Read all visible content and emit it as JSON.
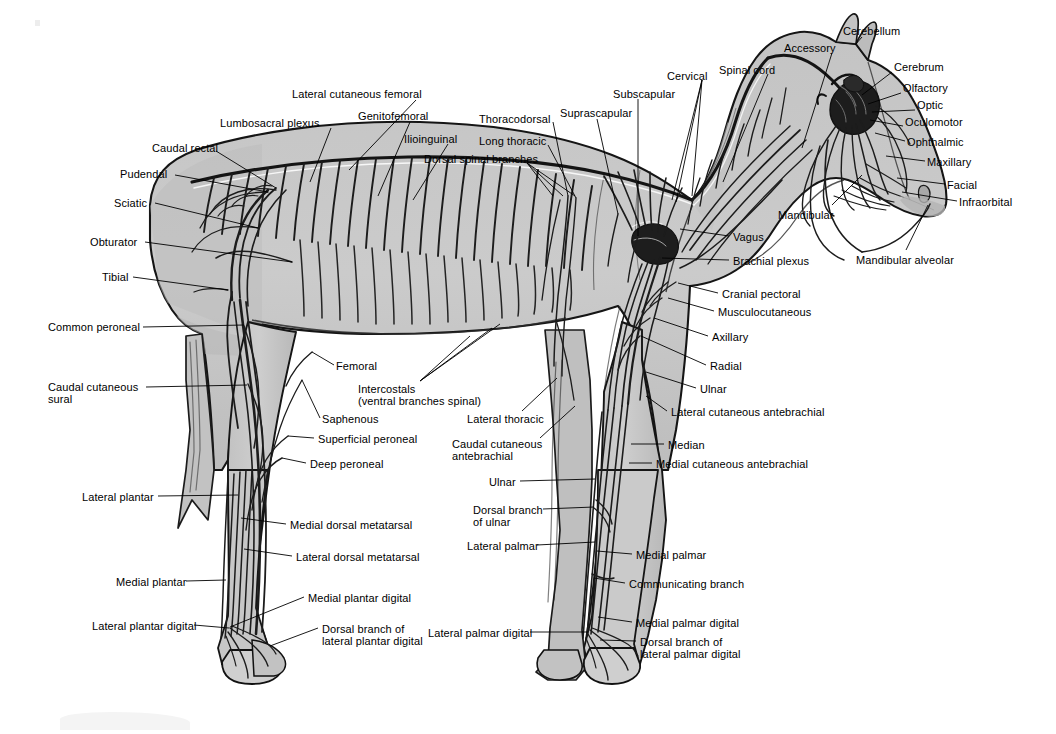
{
  "figure": {
    "view": "left lateral",
    "background_color": "#ffffff",
    "body_fill_color": "#c9c9c9",
    "body_fill_shadow": "#b0b0b0",
    "outline_color": "#111111",
    "nerve_color": "#1a1a1a",
    "leader_color": "#000000",
    "label_color": "#000000",
    "label_font_size_px": 11
  },
  "labels": [
    {
      "id": "lateral-cutaneous-femoral",
      "text": "Lateral cutaneous femoral",
      "x": 292,
      "y": 88,
      "align": "left",
      "leader": [
        [
          416,
          100
        ],
        [
          349,
          170
        ]
      ]
    },
    {
      "id": "lumbosacral-plexus",
      "text": "Lumbosacral plexus",
      "x": 220,
      "y": 117,
      "align": "left",
      "leader": [
        [
          331,
          128
        ],
        [
          310,
          182
        ]
      ]
    },
    {
      "id": "genitofemoral",
      "text": "Genitofemoral",
      "x": 358,
      "y": 110,
      "align": "left",
      "leader": [
        [
          410,
          122
        ],
        [
          378,
          196
        ]
      ]
    },
    {
      "id": "caudal-rectal",
      "text": "Caudal rectal",
      "x": 152,
      "y": 142,
      "align": "left",
      "leader": [
        [
          216,
          151
        ],
        [
          276,
          188
        ]
      ]
    },
    {
      "id": "ilioinguinal",
      "text": "Ilioinguinal",
      "x": 404,
      "y": 133,
      "align": "left",
      "leader": [
        [
          448,
          144
        ],
        [
          413,
          200
        ]
      ]
    },
    {
      "id": "dorsal-spinal-branches",
      "text": "Dorsal spinal branches",
      "x": 424,
      "y": 153,
      "align": "left",
      "leader": [
        [
          527,
          163
        ],
        [
          563,
          196
        ]
      ]
    },
    {
      "id": "pudendal",
      "text": "Pudendal",
      "x": 120,
      "y": 168,
      "align": "left",
      "leader": [
        [
          175,
          175
        ],
        [
          268,
          192
        ]
      ]
    },
    {
      "id": "thoracodorsal",
      "text": "Thoracodorsal",
      "x": 479,
      "y": 113,
      "align": "left",
      "leader": [
        [
          553,
          122
        ],
        [
          568,
          196
        ]
      ]
    },
    {
      "id": "long-thoracic",
      "text": "Long thoracic",
      "x": 479,
      "y": 135,
      "align": "left",
      "leader": [
        [
          548,
          145
        ],
        [
          576,
          198
        ]
      ]
    },
    {
      "id": "suprascapular",
      "text": "Suprascapular",
      "x": 560,
      "y": 107,
      "align": "left",
      "leader": [
        [
          597,
          119
        ],
        [
          618,
          214
        ]
      ]
    },
    {
      "id": "subscapular",
      "text": "Subscapular",
      "x": 613,
      "y": 88,
      "align": "left",
      "leader": [
        [
          638,
          99
        ],
        [
          638,
          236
        ]
      ]
    },
    {
      "id": "cervical",
      "text": "Cervical",
      "x": 667,
      "y": 70,
      "align": "left",
      "leader": [
        [
          702,
          80
        ],
        [
          676,
          202
        ]
      ]
    },
    {
      "id": "spinal-cord",
      "text": "Spinal cord",
      "x": 719,
      "y": 64,
      "align": "left",
      "leader": [
        [
          768,
          74
        ],
        [
          723,
          182
        ]
      ]
    },
    {
      "id": "accessory",
      "text": "Accessory",
      "x": 784,
      "y": 42,
      "align": "left",
      "leader": [
        [
          832,
          53
        ],
        [
          802,
          148
        ]
      ]
    },
    {
      "id": "cerebellum",
      "text": "Cerebellum",
      "x": 843,
      "y": 25,
      "align": "left",
      "leader": [
        [
          862,
          37
        ],
        [
          855,
          45
        ]
      ]
    },
    {
      "id": "cerebrum",
      "text": "Cerebrum",
      "x": 894,
      "y": 61,
      "align": "left",
      "leader": [
        [
          892,
          72
        ],
        [
          862,
          95
        ]
      ]
    },
    {
      "id": "olfactory",
      "text": "Olfactory",
      "x": 903,
      "y": 82,
      "align": "left",
      "leader": [
        [
          901,
          93
        ],
        [
          868,
          104
        ]
      ]
    },
    {
      "id": "optic",
      "text": "Optic",
      "x": 917,
      "y": 99,
      "align": "left",
      "leader": [
        [
          915,
          110
        ],
        [
          872,
          112
        ]
      ]
    },
    {
      "id": "oculomotor",
      "text": "Oculomotor",
      "x": 905,
      "y": 116,
      "align": "left",
      "leader": [
        [
          903,
          126
        ],
        [
          870,
          120
        ]
      ]
    },
    {
      "id": "ophthalmic",
      "text": "Ophthalmic",
      "x": 907,
      "y": 136,
      "align": "left",
      "leader": [
        [
          905,
          141
        ],
        [
          875,
          133
        ]
      ]
    },
    {
      "id": "maxillary",
      "text": "Maxillary",
      "x": 927,
      "y": 156,
      "align": "left",
      "leader": [
        [
          925,
          161
        ],
        [
          886,
          156
        ]
      ]
    },
    {
      "id": "facial",
      "text": "Facial",
      "x": 947,
      "y": 179,
      "align": "left",
      "leader": [
        [
          945,
          184
        ],
        [
          897,
          178
        ]
      ]
    },
    {
      "id": "infraorbital",
      "text": "Infraorbital",
      "x": 959,
      "y": 196,
      "align": "left",
      "leader": [
        [
          957,
          201
        ],
        [
          902,
          192
        ]
      ]
    },
    {
      "id": "mandibular",
      "text": "Mandibular",
      "x": 778,
      "y": 209,
      "align": "left",
      "leader": [
        [
          832,
          205
        ],
        [
          862,
          175
        ]
      ]
    },
    {
      "id": "mandibular-alveolar",
      "text": "Mandibular alveolar",
      "x": 856,
      "y": 254,
      "align": "left",
      "leader": [
        [
          906,
          250
        ],
        [
          928,
          205
        ]
      ]
    },
    {
      "id": "vagus",
      "text": "Vagus",
      "x": 733,
      "y": 231,
      "align": "left",
      "leader": [
        [
          729,
          236
        ],
        [
          680,
          229
        ]
      ]
    },
    {
      "id": "brachial-plexus",
      "text": "Brachial plexus",
      "x": 733,
      "y": 255,
      "align": "left",
      "leader": [
        [
          729,
          260
        ],
        [
          662,
          258
        ]
      ]
    },
    {
      "id": "cranial-pectoral",
      "text": "Cranial pectoral",
      "x": 722,
      "y": 288,
      "align": "left",
      "leader": [
        [
          718,
          293
        ],
        [
          678,
          283
        ]
      ]
    },
    {
      "id": "musculocutaneous",
      "text": "Musculocutaneous",
      "x": 718,
      "y": 306,
      "align": "left",
      "leader": [
        [
          714,
          311
        ],
        [
          668,
          298
        ]
      ]
    },
    {
      "id": "axillary",
      "text": "Axillary",
      "x": 712,
      "y": 331,
      "align": "left",
      "leader": [
        [
          708,
          336
        ],
        [
          654,
          318
        ]
      ]
    },
    {
      "id": "radial",
      "text": "Radial",
      "x": 710,
      "y": 360,
      "align": "left",
      "leader": [
        [
          706,
          365
        ],
        [
          641,
          336
        ]
      ]
    },
    {
      "id": "ulnar-upper",
      "text": "Ulnar",
      "x": 700,
      "y": 383,
      "align": "left",
      "leader": [
        [
          696,
          388
        ],
        [
          646,
          372
        ]
      ]
    },
    {
      "id": "lateral-cutaneous-antebrachial",
      "text": "Lateral cutaneous antebrachial",
      "x": 671,
      "y": 406,
      "align": "left",
      "leader": [
        [
          667,
          411
        ],
        [
          646,
          396
        ]
      ]
    },
    {
      "id": "median",
      "text": "Median",
      "x": 668,
      "y": 439,
      "align": "left",
      "leader": [
        [
          664,
          444
        ],
        [
          631,
          444
        ]
      ]
    },
    {
      "id": "medial-cutaneous-antebrachial",
      "text": "Medial cutaneous antebrachial",
      "x": 656,
      "y": 458,
      "align": "left",
      "leader": [
        [
          652,
          463
        ],
        [
          629,
          463
        ]
      ]
    },
    {
      "id": "sciatic",
      "text": "Sciatic",
      "x": 114,
      "y": 197,
      "align": "left",
      "leader": [
        [
          155,
          203
        ],
        [
          258,
          228
        ]
      ]
    },
    {
      "id": "obturator",
      "text": "Obturator",
      "x": 90,
      "y": 236,
      "align": "left",
      "leader": [
        [
          145,
          242
        ],
        [
          292,
          262
        ]
      ]
    },
    {
      "id": "tibial",
      "text": "Tibial",
      "x": 102,
      "y": 271,
      "align": "left",
      "leader": [
        [
          133,
          277
        ],
        [
          228,
          290
        ]
      ]
    },
    {
      "id": "common-peroneal",
      "text": "Common peroneal",
      "x": 48,
      "y": 321,
      "align": "left",
      "leader": [
        [
          143,
          327
        ],
        [
          244,
          325
        ]
      ]
    },
    {
      "id": "caudal-cutaneous-sural",
      "text": "Caudal cutaneous\nsural",
      "x": 48,
      "y": 381,
      "align": "left",
      "leader": [
        [
          146,
          387
        ],
        [
          247,
          385
        ]
      ]
    },
    {
      "id": "femoral",
      "text": "Femoral",
      "x": 336,
      "y": 360,
      "align": "left",
      "leader": [
        [
          334,
          365
        ],
        [
          312,
          352
        ]
      ]
    },
    {
      "id": "intercostals",
      "text": "Intercostals\n(ventral branches spinal)",
      "x": 358,
      "y": 383,
      "align": "left",
      "leader": [
        [
          420,
          381
        ],
        [
          492,
          328
        ]
      ]
    },
    {
      "id": "saphenous",
      "text": "Saphenous",
      "x": 322,
      "y": 413,
      "align": "left",
      "leader": [
        [
          320,
          418
        ],
        [
          302,
          380
        ]
      ]
    },
    {
      "id": "superficial-peroneal",
      "text": "Superficial peroneal",
      "x": 318,
      "y": 433,
      "align": "left",
      "leader": [
        [
          314,
          438
        ],
        [
          288,
          436
        ]
      ]
    },
    {
      "id": "deep-peroneal",
      "text": "Deep peroneal",
      "x": 310,
      "y": 458,
      "align": "left",
      "leader": [
        [
          306,
          463
        ],
        [
          282,
          458
        ]
      ]
    },
    {
      "id": "lateral-thoracic",
      "text": "Lateral thoracic",
      "x": 467,
      "y": 413,
      "align": "left",
      "leader": [
        [
          522,
          411
        ],
        [
          557,
          378
        ]
      ]
    },
    {
      "id": "caudal-cutaneous-antebrachial",
      "text": "Caudal cutaneous\nantebrachial",
      "x": 452,
      "y": 438,
      "align": "left",
      "leader": [
        [
          540,
          438
        ],
        [
          575,
          406
        ]
      ]
    },
    {
      "id": "lateral-plantar",
      "text": "Lateral plantar",
      "x": 82,
      "y": 491,
      "align": "left",
      "leader": [
        [
          158,
          496
        ],
        [
          238,
          495
        ]
      ]
    },
    {
      "id": "medial-dorsal-metatarsal",
      "text": "Medial dorsal metatarsal",
      "x": 290,
      "y": 519,
      "align": "left",
      "leader": [
        [
          286,
          524
        ],
        [
          241,
          518
        ]
      ]
    },
    {
      "id": "lateral-dorsal-metatarsal",
      "text": "Lateral dorsal metatarsal",
      "x": 296,
      "y": 551,
      "align": "left",
      "leader": [
        [
          292,
          556
        ],
        [
          244,
          549
        ]
      ]
    },
    {
      "id": "medial-plantar",
      "text": "Medial plantar",
      "x": 116,
      "y": 576,
      "align": "left",
      "leader": [
        [
          186,
          581
        ],
        [
          226,
          580
        ]
      ]
    },
    {
      "id": "medial-plantar-digital",
      "text": "Medial plantar digital",
      "x": 308,
      "y": 592,
      "align": "left",
      "leader": [
        [
          304,
          597
        ],
        [
          230,
          627
        ]
      ]
    },
    {
      "id": "lateral-plantar-digital",
      "text": "Lateral plantar digital",
      "x": 92,
      "y": 620,
      "align": "left",
      "leader": [
        [
          194,
          625
        ],
        [
          229,
          628
        ]
      ]
    },
    {
      "id": "dorsal-branch-lateral-plantar-digital",
      "text": "Dorsal branch of\nlateral plantar digital",
      "x": 322,
      "y": 623,
      "align": "left",
      "leader": [
        [
          318,
          628
        ],
        [
          270,
          646
        ]
      ]
    },
    {
      "id": "ulnar-lower",
      "text": "Ulnar",
      "x": 489,
      "y": 476,
      "align": "left",
      "leader": [
        [
          520,
          481
        ],
        [
          595,
          479
        ]
      ]
    },
    {
      "id": "dorsal-branch-of-ulnar",
      "text": "Dorsal branch\nof ulnar",
      "x": 473,
      "y": 504,
      "align": "left",
      "leader": [
        [
          543,
          509
        ],
        [
          594,
          507
        ]
      ]
    },
    {
      "id": "lateral-palmar",
      "text": "Lateral palmar",
      "x": 467,
      "y": 540,
      "align": "left",
      "leader": [
        [
          537,
          545
        ],
        [
          595,
          542
        ]
      ]
    },
    {
      "id": "medial-palmar",
      "text": "Medial palmar",
      "x": 636,
      "y": 549,
      "align": "left",
      "leader": [
        [
          632,
          554
        ],
        [
          597,
          551
        ]
      ]
    },
    {
      "id": "communicating-branch",
      "text": "Communicating branch",
      "x": 629,
      "y": 578,
      "align": "left",
      "leader": [
        [
          625,
          583
        ],
        [
          594,
          578
        ]
      ]
    },
    {
      "id": "medial-palmar-digital",
      "text": "Medial palmar digital",
      "x": 636,
      "y": 617,
      "align": "left",
      "leader": [
        [
          632,
          622
        ],
        [
          598,
          617
        ]
      ]
    },
    {
      "id": "lateral-palmar-digital",
      "text": "Lateral palmar digital",
      "x": 428,
      "y": 627,
      "align": "left",
      "leader": [
        [
          530,
          632
        ],
        [
          588,
          632
        ]
      ]
    },
    {
      "id": "dorsal-branch-lateral-palmar-digital",
      "text": "Dorsal branch of\nlateral palmar digital",
      "x": 640,
      "y": 636,
      "align": "left",
      "leader": [
        [
          636,
          641
        ],
        [
          600,
          640
        ]
      ]
    }
  ]
}
